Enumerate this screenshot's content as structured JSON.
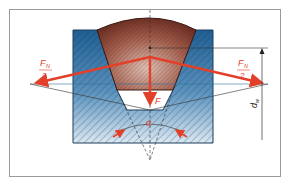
{
  "figure": {
    "labels": {
      "left_force_num": "F",
      "left_force_sub": "N",
      "left_force_den": "2",
      "right_force_num": "F",
      "right_force_sub": "N",
      "right_force_den": "2",
      "center_force": "F",
      "angle": "α",
      "diameter": "d",
      "diameter_sub": "w"
    },
    "colors": {
      "frame": "#9a9a9a",
      "groove_blue": "#2f6f9f",
      "groove_blue_light": "#cfe0ee",
      "belt_brown": "#8a4638",
      "force_red": "#e2402a",
      "line_dark": "#333333"
    }
  }
}
